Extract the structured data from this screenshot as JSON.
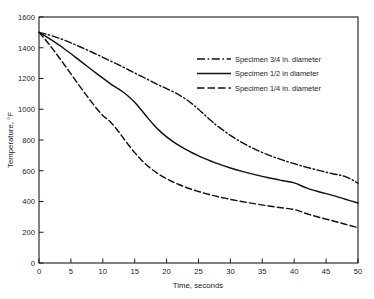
{
  "chart_data": {
    "type": "line",
    "title": "",
    "xlabel": "Time, seconds",
    "ylabel": "Temperature, °F",
    "xlim": [
      0,
      50
    ],
    "ylim": [
      0,
      1600
    ],
    "xticks": [
      0,
      5,
      10,
      15,
      20,
      25,
      30,
      35,
      40,
      45,
      50
    ],
    "yticks": [
      0,
      200,
      400,
      600,
      800,
      1000,
      1200,
      1400,
      1600
    ],
    "xticklabels": [
      "0",
      "5",
      "10",
      "15",
      "20",
      "25",
      "30",
      "35",
      "40",
      "45",
      "50"
    ],
    "yticklabels": [
      "0",
      "200",
      "400",
      "600",
      "800",
      "1000",
      "1200",
      "1400",
      "1600"
    ],
    "grid": false,
    "legend_position": "upper right",
    "x": [
      0,
      1,
      2,
      3,
      4,
      5,
      6,
      7,
      8,
      9,
      10,
      11,
      12,
      13,
      14,
      15,
      16,
      17,
      18,
      19,
      20,
      21,
      22,
      23,
      24,
      25,
      26,
      27,
      28,
      30,
      32,
      34,
      36,
      38,
      40,
      42,
      44,
      46,
      48,
      50
    ],
    "series": [
      {
        "name": "Specimen 3/4 in. diameter",
        "style": "dash-dot",
        "values": [
          1500,
          1490,
          1478,
          1464,
          1449,
          1432,
          1414,
          1396,
          1377,
          1358,
          1338,
          1318,
          1298,
          1278,
          1257,
          1236,
          1215,
          1194,
          1173,
          1153,
          1134,
          1114,
          1092,
          1066,
          1035,
          1000,
          962,
          925,
          890,
          830,
          779,
          737,
          702,
          672,
          646,
          622,
          601,
          581,
          562,
          520
        ]
      },
      {
        "name": "Specimen 1/2 in diameter",
        "style": "solid",
        "values": [
          1500,
          1476,
          1450,
          1422,
          1392,
          1361,
          1329,
          1297,
          1265,
          1233,
          1202,
          1172,
          1144,
          1117,
          1085,
          1045,
          997,
          946,
          898,
          856,
          820,
          790,
          763,
          739,
          717,
          697,
          679,
          662,
          646,
          618,
          594,
          573,
          554,
          537,
          521,
          487,
          462,
          440,
          415,
          390
        ]
      },
      {
        "name": "Specimen 1/4 in. diameter",
        "style": "dashed",
        "values": [
          1500,
          1452,
          1400,
          1345,
          1288,
          1230,
          1172,
          1115,
          1060,
          1006,
          960,
          925,
          880,
          825,
          770,
          718,
          672,
          633,
          600,
          572,
          548,
          527,
          509,
          493,
          478,
          465,
          453,
          442,
          432,
          414,
          398,
          384,
          371,
          359,
          348,
          320,
          296,
          275,
          252,
          230
        ]
      }
    ],
    "legend": [
      {
        "label": "Specimen 3/4 in. diameter",
        "style": "dash-dot"
      },
      {
        "label": "Specimen 1/2 in diameter",
        "style": "solid"
      },
      {
        "label": "Specimen 1/4 in. diameter",
        "style": "dashed"
      }
    ],
    "colors": {
      "line": "#111111",
      "axis": "#1a1a1a",
      "background": "#ffffff"
    }
  }
}
